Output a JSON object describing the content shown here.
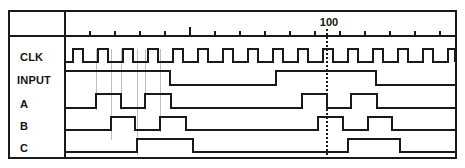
{
  "diagram": {
    "type": "timing-diagram",
    "colors": {
      "background": "#ffffff",
      "trace": "#1a1a1a",
      "frame": "#1a1a1a",
      "guide": "#b9b9b9",
      "cursor": "#1a1a1a"
    },
    "geometry": {
      "width": 465,
      "height": 168,
      "frame": {
        "x": 9,
        "y": 11,
        "width": 447,
        "height": 147
      },
      "label_column_divider_x": 65,
      "axis_baseline_y": 36,
      "row_height": 22
    },
    "axis": {
      "name": "time-axis",
      "origin_x": 65,
      "tick_spacing_px": 25,
      "tick_count": 16,
      "major_tick_index": 5,
      "markers": [
        {
          "label": "100",
          "x": 327,
          "label_x": 329,
          "label_y": 26,
          "cursor": true
        }
      ]
    },
    "signals": [
      {
        "name": "CLK",
        "label": "CLK",
        "row": 0,
        "label_x": 20,
        "label_y": 61,
        "top_y": 49,
        "bottom_y": 62,
        "initial_level": "low",
        "kind": "clock",
        "clock": {
          "start_x": 65,
          "period_px": 25,
          "high_width_px": 10,
          "first_rise_x": 73,
          "pulse_count": 16,
          "end_x": 455
        }
      },
      {
        "name": "INPUT",
        "label": "INPUT",
        "row": 1,
        "label_x": 17,
        "label_y": 84,
        "top_y": 71,
        "bottom_y": 85,
        "initial_level": "high",
        "kind": "data",
        "transitions": [
          {
            "x": 170,
            "to": "low"
          },
          {
            "x": 276,
            "to": "high"
          },
          {
            "x": 376,
            "to": "low"
          }
        ],
        "end_x": 455
      },
      {
        "name": "A",
        "label": "A",
        "row": 2,
        "label_x": 20,
        "label_y": 108,
        "top_y": 94,
        "bottom_y": 108,
        "initial_level": "low",
        "kind": "data",
        "transitions": [
          {
            "x": 96,
            "to": "high"
          },
          {
            "x": 121,
            "to": "low"
          },
          {
            "x": 145,
            "to": "high"
          },
          {
            "x": 171,
            "to": "low"
          },
          {
            "x": 302,
            "to": "high"
          },
          {
            "x": 327,
            "to": "low"
          },
          {
            "x": 351,
            "to": "high"
          },
          {
            "x": 377,
            "to": "low"
          }
        ],
        "end_x": 455
      },
      {
        "name": "B",
        "label": "B",
        "row": 3,
        "label_x": 20,
        "label_y": 130,
        "top_y": 117,
        "bottom_y": 130,
        "initial_level": "low",
        "kind": "data",
        "transitions": [
          {
            "x": 111,
            "to": "high"
          },
          {
            "x": 135,
            "to": "low"
          },
          {
            "x": 160,
            "to": "high"
          },
          {
            "x": 186,
            "to": "low"
          },
          {
            "x": 318,
            "to": "high"
          },
          {
            "x": 343,
            "to": "low"
          },
          {
            "x": 368,
            "to": "high"
          },
          {
            "x": 392,
            "to": "low"
          }
        ],
        "end_x": 455
      },
      {
        "name": "C",
        "label": "C",
        "row": 4,
        "label_x": 20,
        "label_y": 152,
        "top_y": 139,
        "bottom_y": 152,
        "initial_level": "low",
        "kind": "data",
        "transitions": [
          {
            "x": 137,
            "to": "high"
          },
          {
            "x": 193,
            "to": "low"
          },
          {
            "x": 348,
            "to": "high"
          },
          {
            "x": 400,
            "to": "low"
          }
        ],
        "end_x": 455
      }
    ],
    "guides": [
      {
        "x": 96,
        "y1": 49,
        "y2": 110
      },
      {
        "x": 111,
        "y1": 49,
        "y2": 140
      },
      {
        "x": 121,
        "y1": 49,
        "y2": 110
      },
      {
        "x": 137,
        "y1": 49,
        "y2": 155
      },
      {
        "x": 145,
        "y1": 49,
        "y2": 110
      },
      {
        "x": 160,
        "y1": 49,
        "y2": 132
      }
    ]
  }
}
